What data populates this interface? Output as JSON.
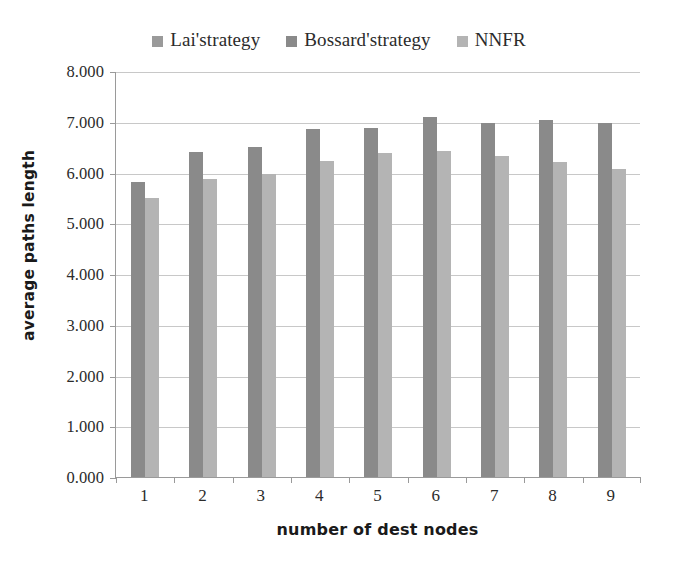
{
  "chart_data": {
    "type": "bar",
    "title": "",
    "xlabel": "number of dest nodes",
    "ylabel": "average paths length",
    "categories": [
      "1",
      "2",
      "3",
      "4",
      "5",
      "6",
      "7",
      "8",
      "9"
    ],
    "ylim": [
      0,
      8
    ],
    "ytick_labels": [
      "0.000",
      "1.000",
      "2.000",
      "3.000",
      "4.000",
      "5.000",
      "6.000",
      "7.000",
      "8.000"
    ],
    "ytick_values": [
      0,
      1,
      2,
      3,
      4,
      5,
      6,
      7,
      8
    ],
    "grid": "horizontal",
    "legend_position": "top-center",
    "series": [
      {
        "name": "Lai'strategy",
        "color": "#9a9a9a",
        "values": [
          0,
          0,
          0,
          0,
          0,
          0,
          0,
          0,
          0
        ]
      },
      {
        "name": "Bossard'strategy",
        "color": "#8a8a8a",
        "values": [
          5.81,
          6.41,
          6.51,
          6.85,
          6.88,
          7.09,
          6.98,
          7.04,
          6.98
        ]
      },
      {
        "name": "NNFR",
        "color": "#b4b4b4",
        "values": [
          5.49,
          5.87,
          5.98,
          6.23,
          6.38,
          6.43,
          6.32,
          6.21,
          6.06
        ]
      }
    ]
  },
  "legend": {
    "items": [
      {
        "label": "Lai'strategy",
        "color": "#9a9a9a",
        "swatch_name": "legend-swatch-lai"
      },
      {
        "label": "Bossard'strategy",
        "color": "#8a8a8a",
        "swatch_name": "legend-swatch-bossard"
      },
      {
        "label": "NNFR",
        "color": "#b4b4b4",
        "swatch_name": "legend-swatch-nnfr"
      }
    ]
  },
  "axes": {
    "y_title": "average paths length",
    "x_title": "number of dest nodes"
  },
  "colors": {
    "gridline": "#c8c8c8",
    "axis": "#9a9a9a",
    "text": "#2b2b2b",
    "background": "#ffffff"
  }
}
